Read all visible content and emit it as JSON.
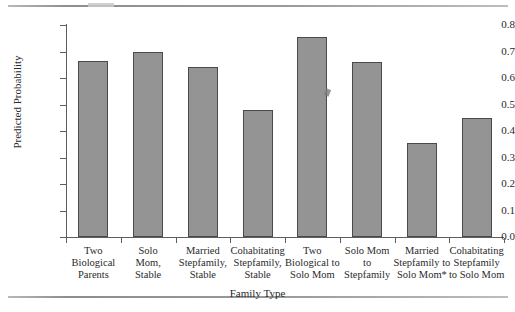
{
  "chart_data": {
    "type": "bar",
    "title": "",
    "xlabel": "Family Type",
    "ylabel": "Predicted Probability",
    "ylim": [
      0.0,
      0.8
    ],
    "ytick_labels": [
      "0.8",
      "0.7",
      "0.6",
      "0.5",
      "0.4",
      "0.3",
      "0.2",
      "0.1",
      "0.0"
    ],
    "ytick_values": [
      0.8,
      0.7,
      0.6,
      0.5,
      0.4,
      0.3,
      0.2,
      0.1,
      0.0
    ],
    "grid": false,
    "legend": "none",
    "categories": [
      "Two Biological Parents",
      "Solo Mom, Stable",
      "Married Stepfamily, Stable",
      "Cohabitating Stepfamily, Stable",
      "Two Biological to Solo Mom",
      "Solo Mom to Stepfamily",
      "Married Stepfamily to Solo Mom*",
      "Cohabitating Stepfamily to Solo Mom"
    ],
    "category_lines": [
      [
        "Two",
        "Biological",
        "Parents"
      ],
      [
        "Solo",
        "Mom,",
        "Stable"
      ],
      [
        "Married",
        "Stepfamily,",
        "Stable"
      ],
      [
        "Cohabitating",
        "Stepfamily,",
        "Stable"
      ],
      [
        "Two",
        "Biological to",
        "Solo Mom"
      ],
      [
        "Solo Mom",
        "to",
        "Stepfamily"
      ],
      [
        "Married",
        "Stepfamily to",
        "Solo Mom*"
      ],
      [
        "Cohabitating",
        "Stepfamily",
        "to Solo Mom"
      ]
    ],
    "values": [
      0.665,
      0.7,
      0.64,
      0.48,
      0.755,
      0.66,
      0.355,
      0.45
    ],
    "bar_color": "#949494",
    "bar_edge_color": "#4a4a4a"
  }
}
